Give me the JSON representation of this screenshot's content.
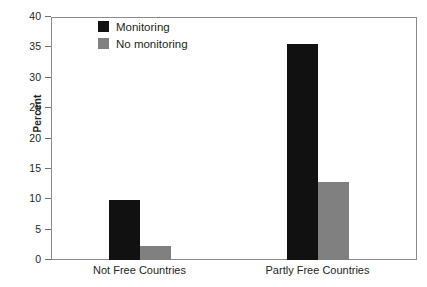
{
  "chart_data": {
    "type": "bar",
    "title": "",
    "xlabel": "",
    "ylabel": "Percent",
    "categories": [
      "Not Free Countries",
      "Partly Free Countries"
    ],
    "series": [
      {
        "name": "Monitoring",
        "color": "#111111",
        "values": [
          9.8,
          35.5
        ]
      },
      {
        "name": "No monitoring",
        "color": "#808080",
        "values": [
          2.3,
          12.9
        ]
      }
    ],
    "ylim": [
      0,
      40
    ],
    "yticks": [
      0,
      5,
      10,
      15,
      20,
      25,
      30,
      35,
      40
    ],
    "ytick_labels": [
      "0",
      "5",
      "10",
      "15",
      "20",
      "25",
      "30",
      "35",
      "40"
    ],
    "grid": false,
    "legend_position": "top-left-inside"
  },
  "legend": {
    "items": [
      {
        "label": "Monitoring",
        "swatch": "legend-swatch-black"
      },
      {
        "label": "No monitoring",
        "swatch": "legend-swatch-gray"
      }
    ]
  },
  "colors": {
    "monitoring": "#111111",
    "no_monitoring": "#808080",
    "axis": "#8a8a8a",
    "text": "#231f20",
    "background": "#ffffff"
  }
}
